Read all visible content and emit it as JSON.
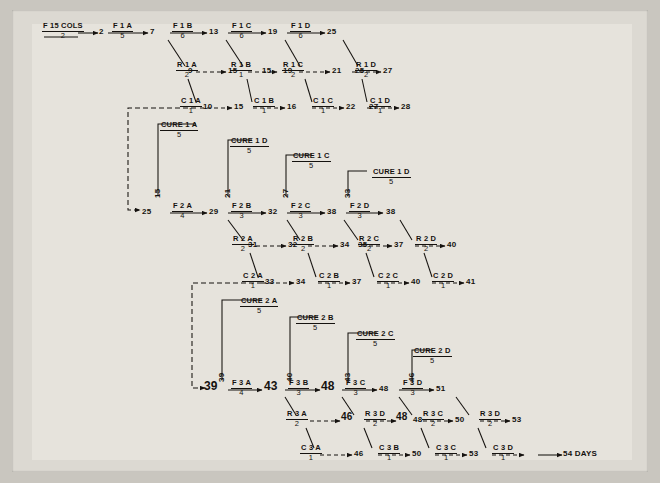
{
  "meta": {
    "paper_color": "#e6e3dc",
    "ink_color": "#15120f",
    "background_color": "#c9c6bf"
  },
  "header": {
    "label": "F 15 COLS",
    "duration": "2",
    "start_node": "2"
  },
  "footer": {
    "end_label": "54 DAYS"
  },
  "rows": [
    {
      "row_name": "row-f1",
      "activities": [
        {
          "name": "F 1 A",
          "dur": "5",
          "from": "2",
          "to": "7"
        },
        {
          "name": "F 1 B",
          "dur": "6",
          "from": "7",
          "to": "13"
        },
        {
          "name": "F 1 C",
          "dur": "6",
          "from": "13",
          "to": "19"
        },
        {
          "name": "F 1 D",
          "dur": "6",
          "from": "19",
          "to": "25"
        }
      ]
    },
    {
      "row_name": "row-r1",
      "activities": [
        {
          "name": "R 1 A",
          "dur": "2",
          "from": "9",
          "to": "15"
        },
        {
          "name": "R 1 B",
          "dur": "1",
          "from": "15",
          "to": "19"
        },
        {
          "name": "R 1 C",
          "dur": "2",
          "from": "19",
          "to": "21"
        },
        {
          "name": "R 1 D",
          "dur": "2",
          "from": "25",
          "to": "27"
        }
      ]
    },
    {
      "row_name": "row-c1",
      "activities": [
        {
          "name": "C 1 A",
          "dur": "1",
          "from": "10",
          "to": "15"
        },
        {
          "name": "C 1 B",
          "dur": "1",
          "from": "15",
          "to": "16"
        },
        {
          "name": "C 1 C",
          "dur": "1",
          "from": "21",
          "to": "22"
        },
        {
          "name": "C 1 D",
          "dur": "1",
          "from": "27",
          "to": "28"
        }
      ]
    },
    {
      "row_name": "row-cure1",
      "activities": [
        {
          "name": "CURE 1 A",
          "dur": "5",
          "riser": "15"
        },
        {
          "name": "CURE 1 D",
          "dur": "5",
          "riser": "21"
        },
        {
          "name": "CURE 1 C",
          "dur": "5",
          "riser": "27"
        },
        {
          "name": "CURE 1 D",
          "dur": "5",
          "riser": "33"
        }
      ]
    },
    {
      "row_name": "row-f2",
      "activities": [
        {
          "name": "F 2 A",
          "dur": "4",
          "from": "25",
          "to": "29"
        },
        {
          "name": "F 2 B",
          "dur": "3",
          "from": "29",
          "to": "32"
        },
        {
          "name": "F 2 C",
          "dur": "3",
          "from": "32",
          "to": "38"
        },
        {
          "name": "F 2 D",
          "dur": "3",
          "from": "38",
          "to": "38"
        }
      ]
    },
    {
      "row_name": "row-r2",
      "activities": [
        {
          "name": "R 2 A",
          "dur": "2",
          "from": "31",
          "to": "32"
        },
        {
          "name": "R 2 B",
          "dur": "2",
          "from": "32",
          "to": "34"
        },
        {
          "name": "R 2 C",
          "dur": "2",
          "from": "35",
          "to": "37"
        },
        {
          "name": "R 2 D",
          "dur": "2",
          "from": "37",
          "to": "40"
        }
      ]
    },
    {
      "row_name": "row-c2",
      "activities": [
        {
          "name": "C 2 A",
          "dur": "1",
          "from": "33",
          "to": "34"
        },
        {
          "name": "C 2 B",
          "dur": "1",
          "from": "34",
          "to": "37"
        },
        {
          "name": "C 2 C",
          "dur": "1",
          "from": "37",
          "to": "40"
        },
        {
          "name": "C 2 D",
          "dur": "1",
          "from": "40",
          "to": "41"
        }
      ]
    },
    {
      "row_name": "row-cure2",
      "activities": [
        {
          "name": "CURE 2 A",
          "dur": "5",
          "riser": "39"
        },
        {
          "name": "CURE 2 B",
          "dur": "5",
          "riser": "40"
        },
        {
          "name": "CURE 2 C",
          "dur": "5",
          "riser": "43"
        },
        {
          "name": "CURE 2 D",
          "dur": "5",
          "riser": "46"
        }
      ]
    },
    {
      "row_name": "row-f3",
      "activities": [
        {
          "name": "F 3 A",
          "dur": "4",
          "from": "39",
          "to": "43"
        },
        {
          "name": "F 3 B",
          "dur": "3",
          "from": "43",
          "to": "48"
        },
        {
          "name": "F 3 C",
          "dur": "3",
          "from": "48",
          "to": "48"
        },
        {
          "name": "F 3 D",
          "dur": "3",
          "from": "48",
          "to": "51"
        }
      ]
    },
    {
      "row_name": "row-r3",
      "activities": [
        {
          "name": "R 3 A",
          "dur": "2",
          "from": "43",
          "to": "46"
        },
        {
          "name": "R 3 B",
          "dur": "2",
          "from": "46",
          "to": "48"
        },
        {
          "name": "R 3 C",
          "dur": "2",
          "from": "48",
          "to": "50"
        },
        {
          "name": "R 3 D",
          "dur": "2",
          "from": "51",
          "to": "53"
        }
      ]
    },
    {
      "row_name": "row-c3",
      "activities": [
        {
          "name": "C 3 A",
          "dur": "1",
          "from": "46",
          "to": "48"
        },
        {
          "name": "C 3 B",
          "dur": "1",
          "from": "48",
          "to": "50"
        },
        {
          "name": "C 3 C",
          "dur": "1",
          "from": "50",
          "to": "53"
        },
        {
          "name": "C 3 D",
          "dur": "1",
          "from": "53",
          "to": "54"
        }
      ]
    }
  ],
  "labels": {
    "f1a": "F 1 A",
    "f1a_d": "5",
    "f1b": "F 1 B",
    "f1b_d": "6",
    "f1c": "F 1 C",
    "f1c_d": "6",
    "f1d": "F 1 D",
    "f1d_d": "6",
    "r1a": "R 1 A",
    "r1a_d": "2",
    "r1b": "R 1 B",
    "r1b_d": "1",
    "r1c": "R 1 C",
    "r1c_d": "2",
    "r1d": "R 1 D",
    "r1d_d": "2",
    "c1a": "C 1 A",
    "c1a_d": "1",
    "c1b": "C 1 B",
    "c1b_d": "1",
    "c1c": "C 1 C",
    "c1c_d": "1",
    "c1d": "C 1 D",
    "c1d_d": "1",
    "cure1a": "CURE 1 A",
    "cure1a_d": "5",
    "cure1b": "CURE 1 D",
    "cure1b_d": "5",
    "cure1c": "CURE 1 C",
    "cure1c_d": "5",
    "cure1d": "CURE 1 D",
    "cure1d_d": "5",
    "f2a": "F 2 A",
    "f2a_d": "4",
    "f2b": "F 2 B",
    "f2b_d": "3",
    "f2c": "F 2 C",
    "f2c_d": "3",
    "f2d": "F 2 D",
    "f2d_d": "3",
    "r2a": "R 2 A",
    "r2a_d": "2",
    "r2b": "R 2 B",
    "r2b_d": "2",
    "r2c": "R 2 C",
    "r2c_d": "2",
    "r2d": "R 2 D",
    "r2d_d": "2",
    "c2a": "C 2 A",
    "c2a_d": "1",
    "c2b": "C 2 B",
    "c2b_d": "1",
    "c2c": "C 2 C",
    "c2c_d": "1",
    "c2d": "C 2 D",
    "c2d_d": "1",
    "cure2a": "CURE 2 A",
    "cure2a_d": "5",
    "cure2b": "CURE 2 B",
    "cure2b_d": "5",
    "cure2c": "CURE 2 C",
    "cure2c_d": "5",
    "cure2d": "CURE 2 D",
    "cure2d_d": "5",
    "f3a": "F 3 A",
    "f3a_d": "4",
    "f3b": "F 3 B",
    "f3b_d": "3",
    "f3c": "F 3 C",
    "f3c_d": "3",
    "f3d": "F 3 D",
    "f3d_d": "3",
    "r3a": "R 3 A",
    "r3a_d": "2",
    "r3b": "R 3 D",
    "r3b_d": "2",
    "r3c": "R 3 C",
    "r3c_d": "2",
    "r3d": "R 3 D",
    "r3d_d": "2",
    "c3a": "C 3 A",
    "c3a_d": "1",
    "c3b": "C 3 B",
    "c3b_d": "1",
    "c3c": "C 3 C",
    "c3c_d": "1",
    "c3d": "C 3 D",
    "c3d_d": "1"
  },
  "nodes": {
    "n2": "2",
    "n7": "7",
    "n13": "13",
    "n19": "19",
    "n25": "25",
    "n9": "9",
    "n15": "15",
    "n15b": "15",
    "n19b": "19",
    "n21": "21",
    "n25b": "25",
    "n27": "27",
    "n10": "10",
    "n15c": "15",
    "n16": "16",
    "n22": "22",
    "n27b": "27",
    "n28": "28",
    "riser15": "15",
    "riser21": "21",
    "riser27": "27",
    "riser33": "33",
    "n25c": "25",
    "n29": "29",
    "n32": "32",
    "n38": "38",
    "n38b": "38",
    "n31": "31",
    "n32b": "32",
    "n34": "34",
    "n35": "35",
    "n37": "37",
    "n40": "40",
    "n33": "33",
    "n34b": "34",
    "n37b": "37",
    "n40b": "40",
    "n41": "41",
    "riser39": "39",
    "riser40": "40",
    "riser43": "43",
    "riser46": "46",
    "n39": "39",
    "n43": "43",
    "n48": "48",
    "n48b": "48",
    "n51": "51",
    "n43b": "43",
    "n46": "46",
    "n48c": "48",
    "n48d": "48",
    "n50": "50",
    "n53": "53",
    "n46b": "46",
    "n48e": "48",
    "n50b": "50",
    "n53b": "53"
  }
}
